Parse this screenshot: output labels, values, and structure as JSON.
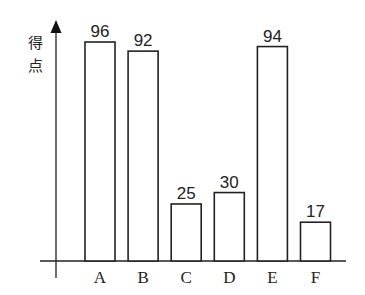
{
  "chart_data": {
    "type": "bar",
    "title": "",
    "xlabel": "",
    "ylabel": "得点",
    "categories": [
      "A",
      "B",
      "C",
      "D",
      "E",
      "F"
    ],
    "values": [
      96,
      92,
      25,
      30,
      94,
      17
    ],
    "ylim": [
      0,
      100
    ],
    "grid": false,
    "legend": null,
    "data_labels": true,
    "bar_fill": "#ffffff",
    "bar_stroke": "#222222"
  }
}
